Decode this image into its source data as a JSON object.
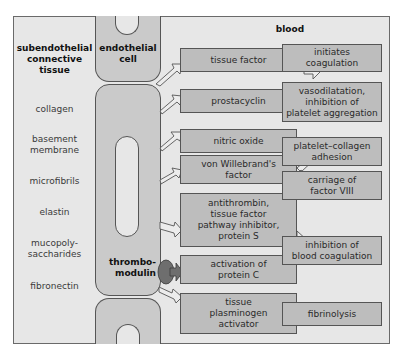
{
  "regions": {
    "subendothelial": "subendothelial\nconnective\ntissue",
    "endothelial": "endothelial\ncell",
    "blood": "blood",
    "thrombomodulin": "thrombo-\nmodulin"
  },
  "tissue_components": [
    "collagen",
    "basement\nmembrane",
    "microfibrils",
    "elastin",
    "mucopoly-\nsaccharides",
    "fibronectin"
  ],
  "factors": [
    "tissue factor",
    "prostacyclin",
    "nitric oxide",
    "von Willebrand's\nfactor",
    "antithrombin,\ntissue factor\npathway inhibitor,\nprotein S",
    "activation of\nprotein C",
    "tissue\nplasminogen\nactivator"
  ],
  "effects": [
    "initiates\ncoagulation",
    "vasodilatation,\ninhibition of\nplatelet aggregation",
    "platelet–collagen\nadhesion",
    "carriage of\nfactor VIII",
    "inhibition of\nblood coagulation",
    "fibrinolysis"
  ],
  "colors": {
    "background": "#e7e7e7",
    "box_fill": "#bdbdbd",
    "cell_fill": "#cacaca",
    "thrombomodulin": "#6e6e6e",
    "border": "#555555"
  }
}
